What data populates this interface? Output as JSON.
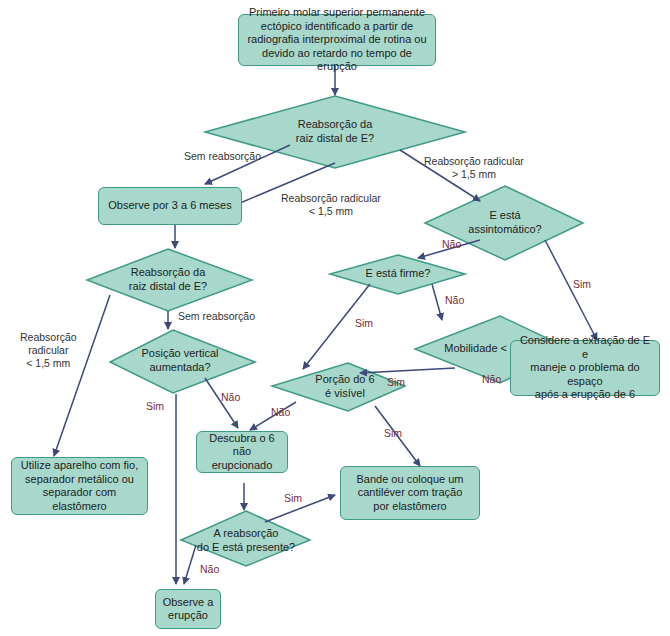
{
  "colors": {
    "node_fill": "#a7d8cb",
    "node_border": "#3f9a88",
    "arrow": "#3d4a7a",
    "label_dark": "#333333",
    "label_answer": "#7a2a3a"
  },
  "nodes": {
    "start": "Primeiro molar superior permanente\nectópico identificado a partir de\nradiografia interproximal de rotina ou\ndevido ao retardo no tempo de erupção",
    "q_resorption_1": "Reabsorção da\nraiz distal de E?",
    "observe_3_6": "Observe por 3 a 6 meses",
    "q_asymptomatic": "E está\nassintomático?",
    "q_firm": "E está firme?",
    "q_resorption_2": "Reabsorção da\nraiz distal de  E?",
    "q_mobility": "Mobilidade < 1 mm?",
    "consider_extraction": "Considere a extração de E e\nmaneje o problema do espaço\napós a erupção de 6",
    "q_vertical": "Posição vertical\naumentada?",
    "q_portion_visible": "Porção do 6\né visível",
    "use_appliance": "Utilize aparelho com fio,\nseparador metálico ou\nseparador com elastômero",
    "uncover": "Descubra o 6\nnão erupcionado",
    "band_cantilever": "Bande ou coloque um\ncantiléver com tração\npor elastômero",
    "q_resorption_present": "A reabsorção\ndo E está presente?",
    "observe_eruption": "Observe a\nerupção"
  },
  "edge_labels": {
    "no_resorption_1": "Sem reabsorção",
    "root_lt_1": "Reabsorção radicular\n< 1,5 mm",
    "root_gt": "Reabsorção radicular\n> 1,5 mm",
    "asym_no": "Não",
    "asym_yes": "Sim",
    "firm_no": "Não",
    "firm_yes": "Sim",
    "root_lt_2": "Reabsorção\nradicular\n< 1,5 mm",
    "no_resorption_2": "Sem reabsorção",
    "mobility_yes": "Sim",
    "mobility_no": "Não",
    "vertical_yes": "Sim",
    "vertical_no": "Não",
    "portion_no": "Não",
    "portion_yes": "Sim",
    "present_yes": "Sim",
    "present_no": "Não"
  }
}
